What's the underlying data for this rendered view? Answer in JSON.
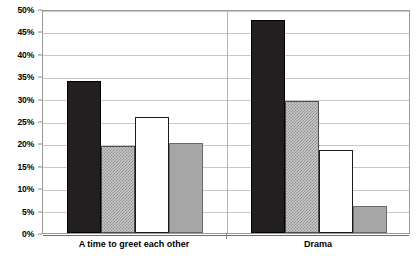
{
  "chart_data": {
    "type": "bar",
    "title": "",
    "xlabel": "",
    "ylabel": "",
    "categories": [
      "A time to greet each other",
      "Drama"
    ],
    "series": [
      {
        "name": "Series 1",
        "style": "black",
        "color": "#231f20",
        "values": [
          34,
          47.5
        ]
      },
      {
        "name": "Series 2",
        "style": "hatched",
        "color": "#c9c9c9",
        "values": [
          19.5,
          29.5
        ]
      },
      {
        "name": "Series 3",
        "style": "white",
        "color": "#ffffff",
        "values": [
          26,
          18.5
        ]
      },
      {
        "name": "Series 4",
        "style": "gray",
        "color": "#a6a6a6",
        "values": [
          20,
          6
        ]
      }
    ],
    "ylim": [
      0,
      50
    ],
    "ytick_step": 5,
    "ytick_labels": [
      "0%",
      "5%",
      "10%",
      "15%",
      "20%",
      "25%",
      "30%",
      "35%",
      "40%",
      "45%",
      "50%"
    ],
    "ytick_values": [
      0,
      5,
      10,
      15,
      20,
      25,
      30,
      35,
      40,
      45,
      50
    ],
    "grid": true,
    "legend": false,
    "value_suffix": "%"
  }
}
